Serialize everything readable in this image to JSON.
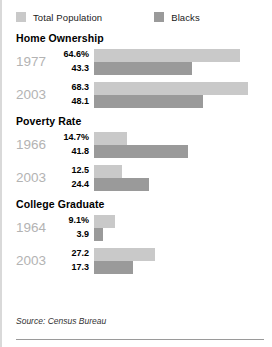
{
  "legend": {
    "items": [
      {
        "label": "Total Population",
        "color": "#c9c9c9",
        "key": "total"
      },
      {
        "label": "Blacks",
        "color": "#9a9a9a",
        "key": "blacks"
      }
    ]
  },
  "footer": {
    "source": "Source: Census Bureau"
  },
  "chart_data": {
    "type": "bar",
    "title": "",
    "orientation": "horizontal",
    "xlabel": "",
    "ylabel": "",
    "xlim": [
      0,
      70
    ],
    "grid": false,
    "legend_position": "top-left",
    "units": "percent",
    "series": [
      {
        "name": "Total Population",
        "color": "#c9c9c9"
      },
      {
        "name": "Blacks",
        "color": "#9a9a9a"
      }
    ],
    "sections": [
      {
        "title": "Home Ownership",
        "groups": [
          {
            "year": "1977",
            "total": {
              "label": "64.6%",
              "value": 64.6
            },
            "blacks": {
              "label": "43.3",
              "value": 43.3
            }
          },
          {
            "year": "2003",
            "total": {
              "label": "68.3",
              "value": 68.3
            },
            "blacks": {
              "label": "48.1",
              "value": 48.1
            }
          }
        ]
      },
      {
        "title": "Poverty Rate",
        "groups": [
          {
            "year": "1966",
            "total": {
              "label": "14.7%",
              "value": 14.7
            },
            "blacks": {
              "label": "41.8",
              "value": 41.8
            }
          },
          {
            "year": "2003",
            "total": {
              "label": "12.5",
              "value": 12.5
            },
            "blacks": {
              "label": "24.4",
              "value": 24.4
            }
          }
        ]
      },
      {
        "title": "College Graduate",
        "groups": [
          {
            "year": "1964",
            "total": {
              "label": "9.1%",
              "value": 9.1
            },
            "blacks": {
              "label": "3.9",
              "value": 3.9
            }
          },
          {
            "year": "2003",
            "total": {
              "label": "27.2",
              "value": 27.2
            },
            "blacks": {
              "label": "17.3",
              "value": 17.3
            }
          }
        ]
      }
    ]
  }
}
